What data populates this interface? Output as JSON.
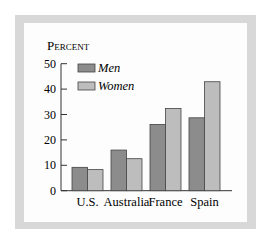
{
  "chart_data": {
    "type": "bar",
    "title": "",
    "ylabel": "Percent",
    "xlabel": "",
    "ylim": [
      0,
      50
    ],
    "yticks": [
      0,
      10,
      20,
      30,
      40,
      50
    ],
    "categories": [
      "U.S.",
      "Australia",
      "France",
      "Spain"
    ],
    "series": [
      {
        "name": "Men",
        "color": "#8c8c8c",
        "values": [
          9.2,
          16.0,
          26.1,
          28.7
        ]
      },
      {
        "name": "Women",
        "color": "#bdbdbd",
        "values": [
          8.3,
          12.6,
          32.4,
          42.9
        ]
      }
    ],
    "legend_position": "upper-left",
    "grid": false
  },
  "labels": {
    "ylabel_display": "PERCENT",
    "yticks": [
      "0",
      "10",
      "20",
      "30",
      "40",
      "50"
    ],
    "categories": [
      "U.S.",
      "Australia",
      "France",
      "Spain"
    ],
    "legend": [
      "Men",
      "Women"
    ]
  }
}
